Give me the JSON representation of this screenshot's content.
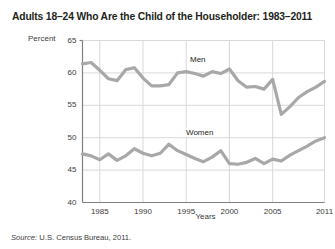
{
  "title": "Adults 18–24 Who Are the Child of the Householder: 1983–2011",
  "axis": {
    "ylabel": "Percent",
    "xlabel": "Years"
  },
  "source": {
    "label": "Source:",
    "text": "U.S. Census Bureau, 2011."
  },
  "series_labels": {
    "men": "Men",
    "women": "Women"
  },
  "colors": {
    "line": "#a8a8a8",
    "grid": "#d9d9d9",
    "axis": "#808080",
    "text": "#231f20"
  },
  "chart_data": {
    "type": "line",
    "title": "Adults 18–24 Who Are the Child of the Householder: 1983–2011",
    "xlabel": "Years",
    "ylabel": "Percent",
    "ylim": [
      40,
      65
    ],
    "yticks": [
      40,
      45,
      50,
      55,
      60,
      65
    ],
    "xlim": [
      1983,
      2011
    ],
    "xticks": [
      1985,
      1990,
      1995,
      2000,
      2005,
      2011
    ],
    "xtick_labels": [
      "1985",
      "1990",
      "1995",
      "2000",
      "2005",
      "2011"
    ],
    "grid": true,
    "legend": "inline-labels",
    "x": [
      1983,
      1984,
      1985,
      1986,
      1987,
      1988,
      1989,
      1990,
      1991,
      1992,
      1993,
      1994,
      1995,
      1996,
      1997,
      1998,
      1999,
      2000,
      2001,
      2002,
      2003,
      2004,
      2005,
      2006,
      2007,
      2008,
      2009,
      2010,
      2011
    ],
    "series": [
      {
        "name": "Men",
        "values": [
          61.4,
          61.6,
          60.4,
          59.1,
          58.8,
          60.5,
          60.8,
          59.2,
          58.0,
          58.0,
          58.2,
          60.0,
          60.2,
          59.9,
          59.5,
          60.2,
          59.9,
          60.6,
          58.8,
          57.8,
          57.9,
          57.5,
          59.0,
          53.6,
          54.8,
          56.2,
          57.1,
          57.8,
          58.7
        ]
      },
      {
        "name": "Women",
        "values": [
          47.5,
          47.2,
          46.6,
          47.5,
          46.5,
          47.2,
          48.3,
          47.6,
          47.2,
          47.6,
          49.0,
          48.0,
          47.4,
          46.8,
          46.3,
          47.0,
          48.0,
          46.0,
          45.9,
          46.2,
          46.8,
          46.0,
          46.7,
          46.4,
          47.3,
          48.0,
          48.7,
          49.5,
          50.0
        ]
      }
    ]
  }
}
